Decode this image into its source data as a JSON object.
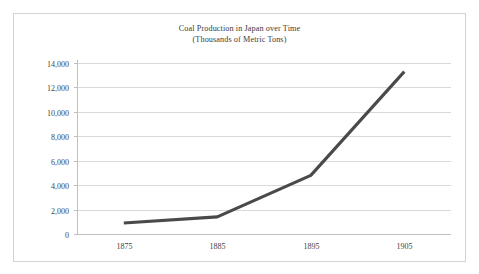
{
  "chart_data": {
    "type": "line",
    "title": "Coal Production in Japan over Time",
    "subtitle": "(Thousands of Metric Tons)",
    "xlabel": "",
    "ylabel": "",
    "x": [
      1875,
      1885,
      1895,
      1905
    ],
    "categories": [
      "1875",
      "1885",
      "1895",
      "1905"
    ],
    "values": [
      900,
      1400,
      4800,
      13300
    ],
    "series": [
      {
        "name": "Coal Production",
        "values": [
          900,
          1400,
          4800,
          13300
        ]
      }
    ],
    "xlim": [
      1870,
      1910
    ],
    "ylim": [
      0,
      14000
    ],
    "y_ticks": [
      0,
      2000,
      4000,
      6000,
      8000,
      10000,
      12000,
      14000
    ],
    "y_tick_labels": [
      "0",
      "2,000",
      "4,000",
      "6,000",
      "8,000",
      "10,000",
      "12,000",
      "14,000"
    ],
    "x_ticks": [
      1875,
      1885,
      1895,
      1905
    ],
    "x_tick_labels": [
      "1875",
      "1885",
      "1895",
      "1905"
    ],
    "grid": "horizontal",
    "legend": "none",
    "line_color": "#4a4a4a",
    "grid_color": "#d9d9d9",
    "border_color": "#d3d3d3",
    "background": "#ffffff"
  }
}
